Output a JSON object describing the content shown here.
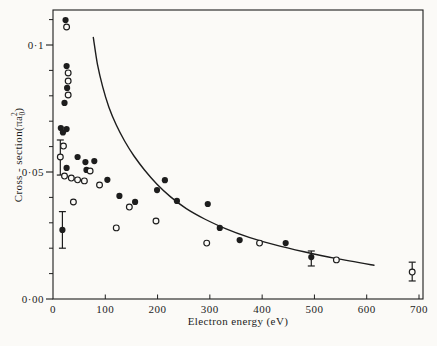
{
  "figure": {
    "background": "#fbfaf7",
    "ink": "#1d1d1d"
  },
  "chart_data": {
    "type": "scatter",
    "title": "",
    "xlabel": "Electron energy (eV)",
    "ylabel_text": "Cross - section(πa₀²)",
    "ylabel_parts": {
      "main": "Cross - section(πa",
      "sub": "0",
      "sup": "2",
      "close": ")"
    },
    "xlim": [
      0,
      707
    ],
    "ylim": [
      0,
      0.1138
    ],
    "grid": false,
    "legend": "none",
    "x_tick_labels": [
      {
        "value": 0,
        "label": "0"
      },
      {
        "value": 100,
        "label": "100"
      },
      {
        "value": 200,
        "label": "200"
      },
      {
        "value": 300,
        "label": "300"
      },
      {
        "value": 400,
        "label": "400"
      },
      {
        "value": 500,
        "label": "500"
      },
      {
        "value": 600,
        "label": "600"
      },
      {
        "value": 700,
        "label": "700"
      }
    ],
    "x_tick_marks": [
      100,
      200,
      300,
      400,
      500,
      600,
      700
    ],
    "y_major_ticks": [
      {
        "value": 0.0,
        "label": "0·00"
      },
      {
        "value": 0.05,
        "label": "0·05"
      },
      {
        "value": 0.1,
        "label": "0·1"
      }
    ],
    "y_minor_ticks": [
      0.01,
      0.02,
      0.03,
      0.04,
      0.06,
      0.07,
      0.08,
      0.09,
      0.11
    ],
    "series": [
      {
        "name": "filled-circle-measurements",
        "marker": "filled-circle",
        "points": [
          [
            24,
            0.1098
          ],
          [
            26,
            0.0917
          ],
          [
            27,
            0.0831
          ],
          [
            22,
            0.0772
          ],
          [
            15,
            0.0673
          ],
          [
            26,
            0.0669
          ],
          [
            19,
            0.0656
          ],
          [
            18,
            0.0272
          ],
          [
            26,
            0.0516
          ],
          [
            47,
            0.0559
          ],
          [
            62,
            0.0539
          ],
          [
            79,
            0.0543
          ],
          [
            64,
            0.0508
          ],
          [
            104,
            0.0469
          ],
          [
            127,
            0.0406
          ],
          [
            157,
            0.0382
          ],
          [
            199,
            0.0429
          ],
          [
            214,
            0.0468
          ],
          [
            237,
            0.0386
          ],
          [
            296,
            0.0374
          ],
          [
            319,
            0.028
          ],
          [
            357,
            0.0232
          ],
          [
            445,
            0.022
          ],
          [
            494,
            0.0165
          ]
        ]
      },
      {
        "name": "open-circle-measurements",
        "marker": "open-circle",
        "points": [
          [
            26,
            0.1071
          ],
          [
            29,
            0.089
          ],
          [
            29,
            0.0858
          ],
          [
            29,
            0.0803
          ],
          [
            20,
            0.0602
          ],
          [
            14,
            0.0559
          ],
          [
            22,
            0.0484
          ],
          [
            35,
            0.0476
          ],
          [
            47,
            0.0469
          ],
          [
            60,
            0.0465
          ],
          [
            39,
            0.0382
          ],
          [
            71,
            0.0504
          ],
          [
            89,
            0.0449
          ],
          [
            121,
            0.028
          ],
          [
            146,
            0.0362
          ],
          [
            197,
            0.0307
          ],
          [
            294,
            0.022
          ],
          [
            395,
            0.022
          ],
          [
            542,
            0.0154
          ],
          [
            687,
            0.0106
          ]
        ]
      },
      {
        "name": "theory-curve",
        "marker": "line",
        "points": [
          [
            77,
            0.103
          ],
          [
            85,
            0.0925
          ],
          [
            95,
            0.0835
          ],
          [
            107,
            0.0755
          ],
          [
            121,
            0.0685
          ],
          [
            137,
            0.0622
          ],
          [
            155,
            0.0563
          ],
          [
            175,
            0.0508
          ],
          [
            199,
            0.0452
          ],
          [
            225,
            0.0402
          ],
          [
            255,
            0.0356
          ],
          [
            290,
            0.0315
          ],
          [
            330,
            0.0277
          ],
          [
            375,
            0.0243
          ],
          [
            425,
            0.0213
          ],
          [
            480,
            0.0186
          ],
          [
            540,
            0.016
          ],
          [
            614,
            0.0133
          ]
        ]
      }
    ],
    "error_bars": [
      {
        "series": "open-circle-measurements",
        "x": 14,
        "y": 0.0559,
        "plus": 0.0067,
        "minus": 0.0071
      },
      {
        "series": "filled-circle-measurements",
        "x": 18,
        "y": 0.0272,
        "plus": 0.0072,
        "minus": 0.0072
      },
      {
        "series": "filled-circle-measurements",
        "x": 494,
        "y": 0.0165,
        "plus": 0.0024,
        "minus": 0.0035
      },
      {
        "series": "open-circle-measurements",
        "x": 687,
        "y": 0.0106,
        "plus": 0.0039,
        "minus": 0.0035
      }
    ]
  }
}
